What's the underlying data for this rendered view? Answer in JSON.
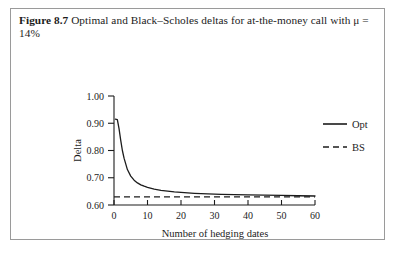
{
  "figure": {
    "label": "Figure 8.7",
    "caption": "Optimal and Black–Scholes deltas for at-the-money call with μ = 14%",
    "frame_color": "#9a9a9a"
  },
  "chart_data": {
    "type": "line",
    "title": "",
    "xlabel": "Number of hedging dates",
    "ylabel": "Delta",
    "xlim": [
      0,
      60
    ],
    "ylim": [
      0.6,
      1.0
    ],
    "xticks": [
      0,
      10,
      20,
      30,
      40,
      50,
      60
    ],
    "xticklabels": [
      "0",
      "10",
      "20",
      "30",
      "40",
      "50",
      "60"
    ],
    "yticks": [
      0.6,
      0.7,
      0.8,
      0.9,
      1.0
    ],
    "yticklabels": [
      "0.60",
      "0.70",
      "0.80",
      "0.90",
      "1.00"
    ],
    "grid": false,
    "legend_position": "right-outside",
    "series": [
      {
        "name": "Opt",
        "style": "solid",
        "color": "#1c1c1c",
        "x": [
          0.4,
          1,
          1.5,
          2,
          2.5,
          3,
          4,
          5,
          6,
          7,
          8,
          9,
          10,
          12,
          14,
          16,
          18,
          20,
          24,
          28,
          32,
          36,
          40,
          45,
          50,
          55,
          60
        ],
        "y": [
          0.915,
          0.913,
          0.88,
          0.838,
          0.8,
          0.772,
          0.73,
          0.706,
          0.691,
          0.681,
          0.674,
          0.669,
          0.665,
          0.658,
          0.654,
          0.651,
          0.648,
          0.646,
          0.643,
          0.641,
          0.639,
          0.638,
          0.637,
          0.636,
          0.635,
          0.634,
          0.633
        ]
      },
      {
        "name": "BS",
        "style": "dashed",
        "color": "#1c1c1c",
        "x": [
          0,
          60
        ],
        "y": [
          0.63,
          0.63
        ]
      }
    ],
    "legend": [
      {
        "name": "Opt",
        "style": "solid"
      },
      {
        "name": "BS",
        "style": "dashed"
      }
    ]
  }
}
